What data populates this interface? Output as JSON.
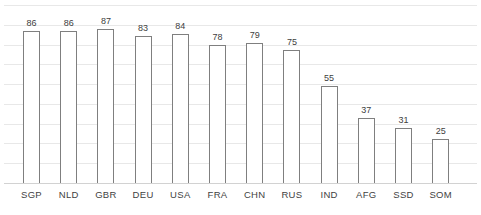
{
  "chart_data": {
    "type": "bar",
    "title": "",
    "subtitle": "",
    "xlabel": "",
    "ylabel": "",
    "categories": [
      "SGP",
      "NLD",
      "GBR",
      "DEU",
      "USA",
      "FRA",
      "CHN",
      "RUS",
      "IND",
      "AFG",
      "SSD",
      "SOM"
    ],
    "values": [
      86,
      86,
      87,
      83,
      84,
      78,
      79,
      75,
      55,
      37,
      31,
      25
    ],
    "data_labels": [
      "86",
      "86",
      "87",
      "83",
      "84",
      "78",
      "79",
      "75",
      "55",
      "37",
      "31",
      "25"
    ],
    "ylim": [
      0,
      92
    ],
    "y_tick_labels": [],
    "gridlines": {
      "horizontal": true,
      "vertical": false,
      "count": 10,
      "color": "#e8e8e8"
    },
    "legend": {
      "visible": false,
      "position": "none",
      "entries": []
    },
    "axis": {
      "y_axis_visible": false,
      "x_axis_visible": true,
      "baseline_color": "#d2d2d2"
    },
    "style": {
      "bar_fill": "#ffffff",
      "bar_stroke": "#7f7f7f",
      "label_color": "#404040",
      "category_color": "#3f3f3f",
      "background": "#ffffff"
    }
  }
}
